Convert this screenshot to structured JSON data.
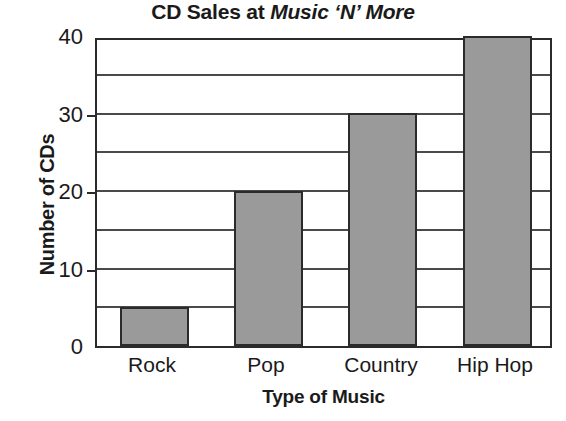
{
  "chart_data": {
    "type": "bar",
    "title_prefix": "CD Sales at ",
    "title_emphasis": "Music ‘N’ More",
    "xlabel": "Type of Music",
    "ylabel": "Number of CDs",
    "categories": [
      "Rock",
      "Pop",
      "Country",
      "Hip Hop"
    ],
    "values": [
      5,
      20,
      30,
      40
    ],
    "ylim": [
      0,
      40
    ],
    "y_major_ticks": [
      0,
      10,
      20,
      30,
      40
    ],
    "y_tick_labels": [
      "0",
      "10",
      "20",
      "30",
      "40"
    ],
    "y_gridline_interval": 5,
    "y_gridlines": [
      5,
      10,
      15,
      20,
      25,
      30,
      35
    ],
    "grid": true,
    "legend": "none",
    "bar_color": "#9a9a9a",
    "bar_edge_color": "#2b2b2b",
    "axis_color": "#2b2b2b",
    "background_color": "#ffffff"
  }
}
